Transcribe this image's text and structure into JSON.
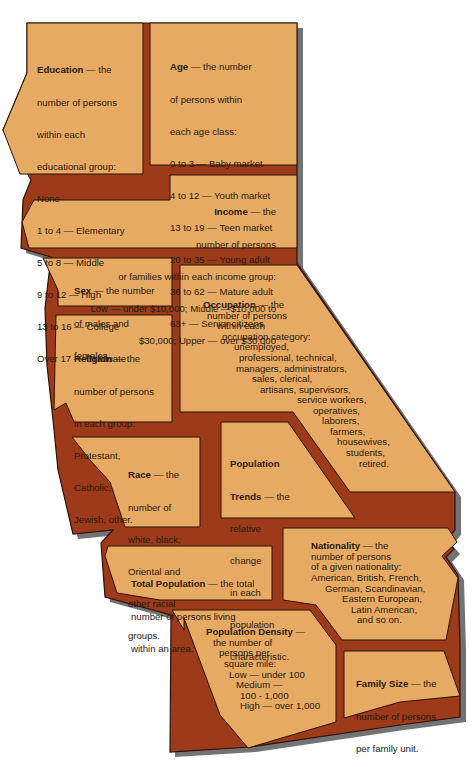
{
  "diagram": {
    "colors": {
      "region_fill": "#e6aa63",
      "divider": "#9c3a1a",
      "outline": "#2a1208",
      "shadow": "#5a5a5a",
      "text": "#2a1a10",
      "background": "#ffffff"
    },
    "regions": {
      "education": {
        "term": "Education",
        "lines": [
          "— the",
          "number of persons",
          "within each",
          "educational group:",
          "None",
          "1 to 4 — Elementary",
          "5 to 8 — Middle",
          "9 to 12 — High",
          "13 to 16 — College",
          "Over 17 — Graduate"
        ]
      },
      "age": {
        "term": "Age",
        "lines": [
          "— the number",
          "of persons within",
          "each age class:",
          "0 to 3 — Baby market",
          "4 to 12 — Youth market",
          "13 to 19 — Teen market",
          "20 to 35 — Young adult",
          "36 to 62 — Mature adult",
          "63+ — Senior citizens"
        ]
      },
      "income": {
        "term": "Income",
        "lines": [
          "— the",
          "number of persons",
          "or families within each income group:",
          "Low — under $10,000; Middle —$10,000 to",
          "$30,000; Upper — over $30,000"
        ]
      },
      "sex": {
        "term": "Sex",
        "lines": [
          "— the number",
          "of males and",
          "females."
        ]
      },
      "religion": {
        "term": "Religion",
        "lines": [
          "— the",
          "number of persons",
          "in each group:",
          "Protestant,",
          "Catholic,",
          "Jewish, other."
        ]
      },
      "occupation": {
        "term": "Occupation",
        "lines": [
          "— the",
          "number of persons",
          "within each",
          "occupation category:",
          "unemployed,",
          "professional, technical,",
          "managers, administrators,",
          "sales, clerical,",
          "artisans, supervisors,",
          "service workers,",
          "operatives,",
          "laborers,",
          "farmers,",
          "housewives,",
          "students,",
          "retired."
        ]
      },
      "race": {
        "term": "Race",
        "lines": [
          "— the",
          "number of",
          "white, black,",
          "Oriental and",
          "other racial",
          "groups."
        ]
      },
      "population_trends": {
        "term": "Population",
        "term2": "Trends",
        "lines": [
          "— the",
          "relative",
          "change",
          "in each",
          "population",
          "characteristic."
        ]
      },
      "total_population": {
        "term": "Total Population",
        "lines": [
          "— the total",
          "number of persons living",
          "within an area."
        ]
      },
      "nationality": {
        "term": "Nationality",
        "lines": [
          "— the",
          "number of persons",
          "of a given nationality:",
          "American, British, French,",
          "German, Scandinavian,",
          "Eastern European,",
          "Latin American,",
          "and so on."
        ]
      },
      "population_density": {
        "term": "Population Density",
        "lines": [
          "—",
          "the number of",
          "persons per",
          "square mile:",
          "Low — under 100",
          "Medium —",
          "100 - 1,000",
          "High — over 1,000"
        ]
      },
      "family_size": {
        "term": "Family Size",
        "lines": [
          "— the",
          "number of persons",
          "per family unit."
        ]
      }
    }
  }
}
